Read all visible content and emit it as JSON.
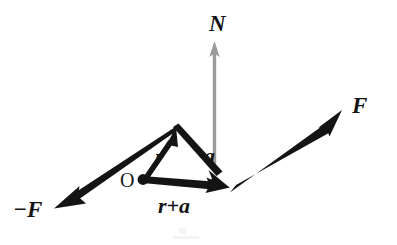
{
  "figure": {
    "background_color": "#ffffff",
    "width": 397,
    "height": 245
  },
  "colors": {
    "ink": "#141414",
    "gray_vector": "#9b9b9b",
    "background": "#ffffff"
  },
  "labels": {
    "normal_vector": "N",
    "force_positive": "F",
    "force_negative": "−F",
    "position_vector": "r",
    "offset_vector": "a",
    "sum_vector": "r+a",
    "origin": "O"
  },
  "vectors": [
    {
      "id": "N",
      "label": "N",
      "color": "#9b9b9b",
      "style": "gray-thin",
      "from": [
        214.5,
        168.0
      ],
      "to": [
        214.5,
        42.0
      ],
      "label_pos": [
        209,
        30
      ],
      "description": "Vertical gray moment vector N pointing up"
    },
    {
      "id": "a",
      "label": "a",
      "color": "#141414",
      "style": "black-thick",
      "from": [
        176.0,
        128.0
      ],
      "to": [
        228.0,
        186.0
      ],
      "label_pos": [
        203,
        162
      ],
      "description": "Vector a from triangle apex down-right to the F application point"
    },
    {
      "id": "r",
      "label": "r",
      "color": "#141414",
      "style": "black-thick",
      "from": [
        143.0,
        179.0
      ],
      "to": [
        175.0,
        128.0
      ],
      "label_pos": [
        155,
        163
      ],
      "description": "Position vector r from origin O up-right to apex"
    },
    {
      "id": "r+a",
      "label": "r+a",
      "color": "#141414",
      "style": "black-thick",
      "from": [
        143.0,
        179.0
      ],
      "to": [
        228.0,
        187.0
      ],
      "label_pos": [
        159,
        212
      ],
      "description": "Resultant vector r+a from origin O to the F application point"
    },
    {
      "id": "F",
      "label": "F",
      "color": "#141414",
      "style": "black-thick",
      "from": [
        232.0,
        189.0
      ],
      "to": [
        341.0,
        110.0
      ],
      "label_pos": [
        352,
        112
      ],
      "description": "Force F pointing up-right from the application point"
    },
    {
      "id": "-F",
      "label": "−F",
      "color": "#141414",
      "style": "black-thick",
      "from": [
        176.0,
        129.0
      ],
      "to": [
        55.0,
        208.0
      ],
      "label_pos": [
        14,
        215
      ],
      "description": "Force minus F pointing down-left from the apex"
    }
  ],
  "points": [
    {
      "id": "origin",
      "label": "O",
      "at": [
        143.0,
        179.0
      ],
      "radius": 5.0,
      "label_pos": [
        120,
        186
      ],
      "description": "Origin point O marked with a filled dot"
    }
  ]
}
